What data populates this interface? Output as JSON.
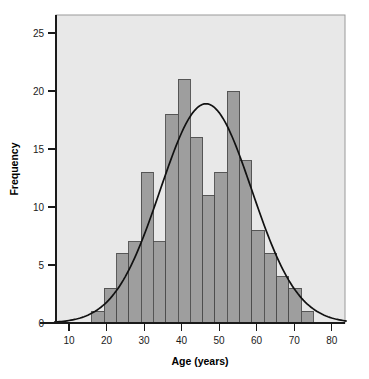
{
  "chart_data": {
    "type": "bar",
    "title": "",
    "subtitle": "",
    "xlabel": "Age (years)",
    "ylabel": "Frequency",
    "xlim": [
      6,
      84
    ],
    "ylim": [
      0,
      26.5
    ],
    "xticks": [
      10,
      20,
      30,
      40,
      50,
      60,
      70,
      80
    ],
    "yticks": [
      0,
      5,
      10,
      15,
      20,
      25
    ],
    "grid": false,
    "legend": null,
    "bin_width": 3.28,
    "bin_start": 16.1,
    "bin_edges": [
      16.1,
      19.38,
      22.66,
      25.94,
      29.22,
      32.5,
      35.78,
      39.06,
      42.34,
      45.62,
      48.9,
      52.18,
      55.46,
      58.74,
      62.02,
      65.3,
      68.58,
      71.86,
      75.14
    ],
    "categories": [
      "16.1-19.4",
      "19.4-22.7",
      "22.7-25.9",
      "25.9-29.2",
      "29.2-32.5",
      "32.5-35.8",
      "35.8-39.1",
      "39.1-42.3",
      "42.3-45.6",
      "45.6-48.9",
      "48.9-52.2",
      "52.2-55.5",
      "55.5-58.7",
      "58.7-62.0",
      "62.0-65.3",
      "65.3-68.6",
      "68.6-71.9",
      "71.9-75.1"
    ],
    "values": [
      1,
      3,
      6,
      7,
      13,
      7,
      18,
      21,
      16,
      11,
      13,
      20,
      14,
      8,
      6,
      4,
      3,
      1
    ],
    "overlay": {
      "name": "normal-curve",
      "type": "line",
      "mean": 46.5,
      "sd": 12.2,
      "peak_value": 18.9,
      "color": "#111111"
    },
    "bar_fill": "#9e9e9e",
    "bar_stroke": "#4d4d4d",
    "panel_background": "#e8e8e8",
    "panel_border": "#9a9a9a",
    "axis_color": "#1a1a1a"
  },
  "axes": {
    "y_tick_labels": [
      "0",
      "5",
      "10",
      "15",
      "20",
      "25"
    ],
    "x_tick_labels": [
      "10",
      "20",
      "30",
      "40",
      "50",
      "60",
      "70",
      "80"
    ],
    "y_axis_title": "Frequency",
    "x_axis_title": "Age (years)"
  }
}
